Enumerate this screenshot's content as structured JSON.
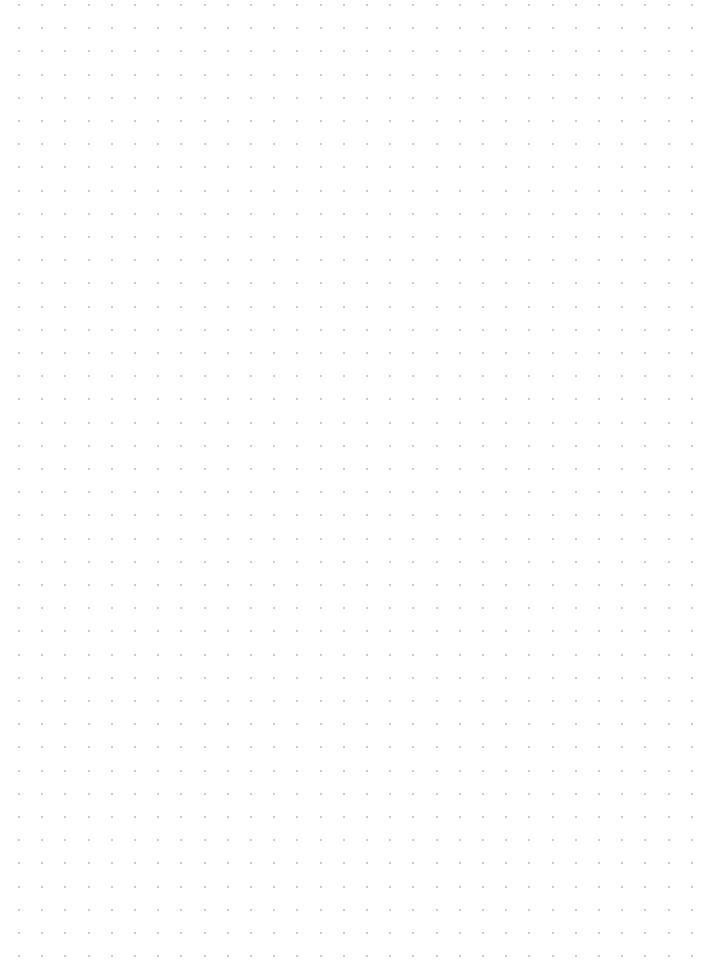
{
  "page": {
    "type": "dot-grid-paper",
    "background_color": "#ffffff",
    "dot_color": "#b8b8b8",
    "dot_spacing_px": 23.2,
    "origin_x": 19,
    "origin_y": 5,
    "columns": 30,
    "rows": 42
  }
}
